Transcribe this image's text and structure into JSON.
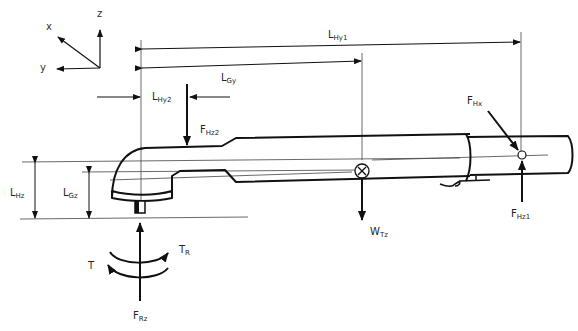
{
  "diagram": {
    "type": "engineering-free-body-diagram",
    "colors": {
      "line": "#111111",
      "thin_line": "#444444",
      "background": "#ffffff"
    },
    "axes": {
      "x": "x",
      "y": "y",
      "z": "z"
    },
    "dimensions": [
      {
        "id": "LHy1",
        "main": "L",
        "sub": "Hy1"
      },
      {
        "id": "LGy",
        "main": "L",
        "sub": "Gy"
      },
      {
        "id": "LHy2",
        "main": "L",
        "sub": "Hy2"
      },
      {
        "id": "LHz",
        "main": "L",
        "sub": "Hz"
      },
      {
        "id": "LGz",
        "main": "L",
        "sub": "Gz"
      }
    ],
    "forces": [
      {
        "id": "FHz2",
        "main": "F",
        "sub": "Hz2"
      },
      {
        "id": "FHx",
        "main": "F",
        "sub": "Hx"
      },
      {
        "id": "FHz1",
        "main": "F",
        "sub": "Hz1"
      },
      {
        "id": "WTz",
        "main": "W",
        "sub": "Tz"
      },
      {
        "id": "FRz",
        "main": "F",
        "sub": "Rz"
      }
    ],
    "torques": [
      {
        "id": "T",
        "main": "T",
        "sub": ""
      },
      {
        "id": "TR",
        "main": "T",
        "sub": "R"
      }
    ]
  }
}
